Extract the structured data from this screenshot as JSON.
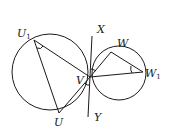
{
  "diagram": {
    "type": "geometry",
    "colors": {
      "stroke": "#1a1a1a",
      "background": "#ffffff"
    },
    "circles": [
      {
        "name": "large-circle",
        "cx": 50,
        "cy": 72,
        "r": 38
      },
      {
        "name": "small-circle",
        "cx": 119,
        "cy": 73,
        "r": 27
      }
    ],
    "points": {
      "V": {
        "x": 90,
        "y": 77
      },
      "U1": {
        "x": 34,
        "y": 40
      },
      "U": {
        "x": 59,
        "y": 113
      },
      "W": {
        "x": 111,
        "y": 52
      },
      "W1": {
        "x": 143,
        "y": 72
      },
      "X": {
        "x": 92,
        "y": 36
      },
      "Y": {
        "x": 88,
        "y": 117
      }
    },
    "labels": [
      {
        "id": "U1",
        "main": "U",
        "sub": "1",
        "x": 17,
        "y": 37
      },
      {
        "id": "X",
        "main": "X",
        "sub": "",
        "x": 97,
        "y": 33
      },
      {
        "id": "W",
        "main": "W",
        "sub": "",
        "x": 117,
        "y": 47
      },
      {
        "id": "W1",
        "main": "W",
        "sub": "1",
        "x": 145,
        "y": 77
      },
      {
        "id": "V",
        "main": "V",
        "sub": "",
        "x": 76,
        "y": 84
      },
      {
        "id": "U",
        "main": "U",
        "sub": "",
        "x": 54,
        "y": 126
      },
      {
        "id": "Y",
        "main": "Y",
        "sub": "",
        "x": 94,
        "y": 121
      }
    ],
    "segments": [
      [
        "U1",
        "V"
      ],
      [
        "U1",
        "U"
      ],
      [
        "U",
        "V"
      ],
      [
        "W",
        "V"
      ],
      [
        "W",
        "W1"
      ],
      [
        "W1",
        "V"
      ],
      [
        "X",
        "Y"
      ]
    ]
  }
}
